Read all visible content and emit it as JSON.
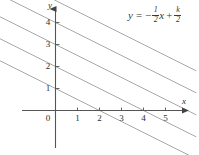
{
  "figure": {
    "title": "",
    "equation": {
      "lhs": "y",
      "eq": "=",
      "minus": "−",
      "frac1_num": "1",
      "frac1_den": "2",
      "var_x": "x",
      "plus": "+",
      "frac2_num": "k",
      "frac2_den": "2"
    },
    "axis_labels": {
      "x": "x",
      "y": "y"
    },
    "colors": {
      "axis": "#555555",
      "line": "#9a9a9a",
      "text": "#2e2e2e",
      "background": "#ffffff"
    }
  },
  "chart_data": {
    "type": "line",
    "title": "",
    "xlabel": "x",
    "ylabel": "y",
    "grid": false,
    "legend": null,
    "xlim": [
      -2.6,
      6.4
    ],
    "ylim": [
      -2.0,
      5.3
    ],
    "x_ticks": [
      0,
      1,
      2,
      3,
      4,
      5
    ],
    "x_tick_labels": [
      "0",
      "1",
      "2",
      "3",
      "4",
      "5"
    ],
    "y_ticks": [
      1,
      2,
      3,
      4
    ],
    "y_tick_labels": [
      "1",
      "2",
      "3",
      "4"
    ],
    "annotations": [
      {
        "text": "y = -1/2 x + k/2",
        "x": 3.3,
        "y": 5.0
      }
    ],
    "series": [
      {
        "name": "k = 2",
        "slope": -0.5,
        "intercept": 1,
        "x": [
          -2.6,
          6.4
        ],
        "values": [
          2.3,
          -2.2
        ]
      },
      {
        "name": "k = 4",
        "slope": -0.5,
        "intercept": 2,
        "x": [
          -2.6,
          6.4
        ],
        "values": [
          3.3,
          -1.2
        ]
      },
      {
        "name": "k = 6",
        "slope": -0.5,
        "intercept": 3,
        "x": [
          -2.6,
          6.4
        ],
        "values": [
          4.3,
          -0.2
        ]
      },
      {
        "name": "k = 8",
        "slope": -0.5,
        "intercept": 4,
        "x": [
          -2.6,
          6.4
        ],
        "values": [
          5.3,
          0.8
        ]
      },
      {
        "name": "k = 10",
        "slope": -0.5,
        "intercept": 5,
        "x": [
          -2.6,
          6.4
        ],
        "values": [
          6.3,
          1.8
        ]
      }
    ]
  }
}
